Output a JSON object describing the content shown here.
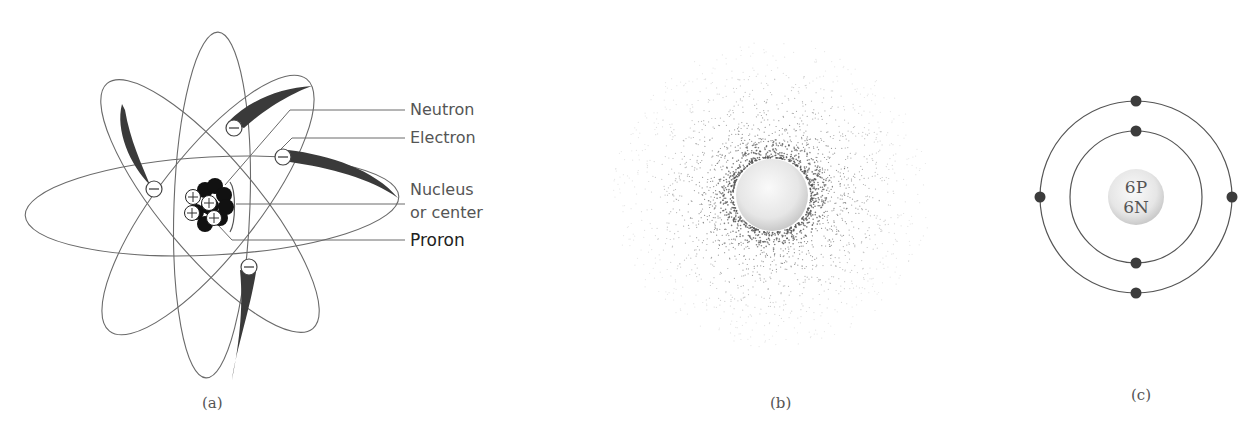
{
  "panels": [
    {
      "id": "a",
      "caption": "(a)",
      "title": "Classical atom model with orbiting electrons",
      "labels": {
        "neutron": "Neutron",
        "electron": "Electron",
        "nucleus_line1": "Nucleus",
        "nucleus_line2": "or center",
        "proton": "Proron"
      },
      "electron_symbol": "−",
      "proton_symbol": "+",
      "electron_count": 5,
      "proton_count": 4
    },
    {
      "id": "b",
      "caption": "(b)",
      "title": "Electron cloud model"
    },
    {
      "id": "c",
      "caption": "(c)",
      "nucleus_line1": "6P",
      "nucleus_line2": "6N",
      "shells": [
        {
          "name": "inner",
          "electrons": 2
        },
        {
          "name": "outer",
          "electrons": 4
        }
      ]
    }
  ],
  "colors": {
    "line": "#6a6a6a",
    "trail": "#3a3a3a",
    "nucleus_dark": "#111111",
    "dot": "#3c3c3c",
    "sphere_light": "#f4f4f4",
    "sphere_shade": "#cfcfcf"
  }
}
